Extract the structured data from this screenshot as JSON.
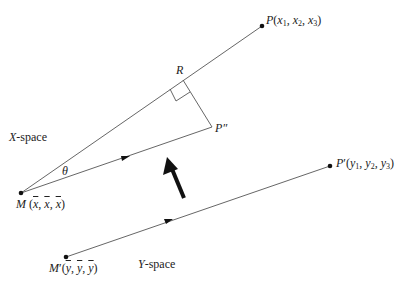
{
  "diagram": {
    "colors": {
      "line": "#555555",
      "point": "#111111",
      "arrow": "#111111",
      "text": "#222222"
    },
    "labels": {
      "P": {
        "name": "P",
        "args": [
          "x",
          "1",
          "x",
          "2",
          "x",
          "3"
        ]
      },
      "R": "R",
      "P_double_prime": "P″",
      "x_space": "X-space",
      "theta": "θ",
      "M": "M",
      "M_bar": "x",
      "P_prime": "P′",
      "M_prime": "M′",
      "M_prime_bar": "y",
      "y_space": "Y-space"
    },
    "text": {
      "P_label": "P(x₁, x₂, x₃)",
      "P_prime_label": "P′(y₁, y₂, y₃)",
      "M_label": "M (x̄, x̄, x̄)",
      "M_prime_label": "M′(ȳ, ȳ, ȳ)",
      "R_label": "R",
      "P_double_prime_label": "P″",
      "theta_label": "θ",
      "x_space_label": "X-space",
      "y_space_label": "Y-space"
    },
    "points": {
      "M": [
        21,
        193
      ],
      "P": [
        262,
        26
      ],
      "R": [
        183,
        80
      ],
      "P_double_prime": [
        212,
        127
      ],
      "M_prime": [
        66,
        257
      ],
      "P_prime": [
        330,
        166
      ]
    }
  }
}
